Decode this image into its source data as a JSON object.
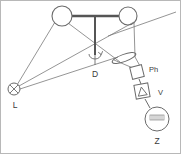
{
  "figure": {
    "width": 181,
    "height": 154,
    "background_color": "#ffffff",
    "border_color": "#b0b0b0",
    "line_color": "#6b6b6b",
    "thick_line_color": "#555555",
    "text_color": "#3a3a3a"
  },
  "labels": {
    "lamp": "L",
    "disk": "D",
    "photodetector": "Ph",
    "amplifier": "V",
    "oscilloscope": "Z"
  },
  "components": [
    {
      "id": "lamp",
      "name": "light-source",
      "label": "L",
      "symbol": "circle-with-x",
      "cx": 14,
      "cy": 89,
      "r": 6
    },
    {
      "id": "pulley-left",
      "name": "left-wheel",
      "label": "",
      "symbol": "circle",
      "cx": 62,
      "cy": 16,
      "r": 10
    },
    {
      "id": "pulley-right",
      "name": "right-wheel",
      "label": "",
      "symbol": "circle",
      "cx": 128,
      "cy": 16,
      "r": 9
    },
    {
      "id": "disk-axis",
      "name": "rotation-axis",
      "label": "D",
      "symbol": "vertical-shaft-with-rotation-arrow",
      "x": 95,
      "y_top": 18,
      "y_bottom": 62
    },
    {
      "id": "lens",
      "name": "lens",
      "label": "",
      "symbol": "ellipse",
      "cx": 124,
      "cy": 58,
      "rx": 12,
      "ry": 4,
      "rotation": -18
    },
    {
      "id": "photodetector",
      "name": "photodetector",
      "label": "Ph",
      "symbol": "tilted-square",
      "cx": 137,
      "cy": 72,
      "size": 11,
      "rotation": -12
    },
    {
      "id": "amplifier",
      "name": "amplifier",
      "label": "V",
      "symbol": "square-with-triangle",
      "cx": 142,
      "cy": 91,
      "size": 13,
      "rotation": -10
    },
    {
      "id": "oscilloscope",
      "name": "oscilloscope",
      "label": "Z",
      "symbol": "circle-with-waveform",
      "cx": 157,
      "cy": 119,
      "r": 12
    }
  ],
  "label_positions": {
    "lamp": {
      "x": 15,
      "y": 106
    },
    "disk": {
      "x": 95,
      "y": 76
    },
    "photodetector": {
      "x": 152,
      "y": 74
    },
    "amplifier": {
      "x": 159,
      "y": 94
    },
    "oscilloscope": {
      "x": 157,
      "y": 143
    }
  }
}
